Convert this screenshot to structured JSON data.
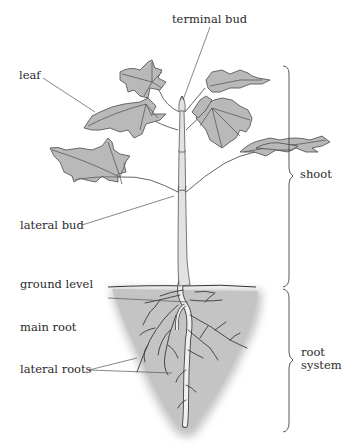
{
  "diagram": {
    "title": "",
    "labels": {
      "terminal_bud": "terminal bud",
      "leaf": "leaf",
      "lateral_bud": "lateral bud",
      "ground_level": "ground level",
      "main_root": "main root",
      "lateral_roots": "lateral roots"
    },
    "groups": {
      "shoot": "shoot",
      "root_system_line1": "root",
      "root_system_line2": "system"
    },
    "colors": {
      "leaf_fill": "#b9b9b9",
      "soil_fill": "#c4c4c4",
      "outline": "#4a4a4a",
      "text": "#2a2a2a"
    }
  }
}
